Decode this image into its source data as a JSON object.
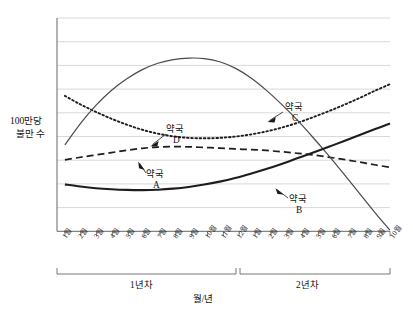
{
  "chart_data": {
    "type": "line",
    "title": "",
    "xlabel": "월/년",
    "ylabel": "100만당 불만 수",
    "ylabel_line1": "100만당",
    "ylabel_line2": "불만 수",
    "grid": true,
    "legend_position": "inline-annotations",
    "xlim": [
      0,
      21
    ],
    "ylim": [
      0,
      10
    ],
    "categories": [
      "1월",
      "2월",
      "3월",
      "4월",
      "5월",
      "6월",
      "7월",
      "8월",
      "9월",
      "10월",
      "11월",
      "12월",
      "1월",
      "2월",
      "3월",
      "4월",
      "5월",
      "6월",
      "7월",
      "8월",
      "9월",
      "10월"
    ],
    "x_groups": [
      {
        "label": "1년차",
        "start_index": 0,
        "end_index": 11
      },
      {
        "label": "2년차",
        "start_index": 12,
        "end_index": 21
      }
    ],
    "series": [
      {
        "name": "약국 A",
        "label_line1": "약국",
        "label_line2": "A",
        "style": "dashed",
        "color": "#1d1d1d",
        "values": [
          3.35,
          3.47,
          3.58,
          3.69,
          3.8,
          3.89,
          3.95,
          3.97,
          3.96,
          3.93,
          3.9,
          3.86,
          3.83,
          3.79,
          3.73,
          3.66,
          3.58,
          3.48,
          3.37,
          3.25,
          3.12,
          3.0
        ]
      },
      {
        "name": "약국 B",
        "label_line1": "약국",
        "label_line2": "B",
        "style": "solid-thick",
        "color": "#1d1d1d",
        "values": [
          2.2,
          2.1,
          2.02,
          1.97,
          1.94,
          1.93,
          1.95,
          2.0,
          2.08,
          2.19,
          2.33,
          2.5,
          2.7,
          2.92,
          3.16,
          3.42,
          3.68,
          3.95,
          4.22,
          4.5,
          4.78,
          5.05
        ]
      },
      {
        "name": "약국 C",
        "label_line1": "약국",
        "label_line2": "C",
        "style": "solid-thin",
        "color": "#4a4a4a",
        "values": [
          4.05,
          5.05,
          5.9,
          6.6,
          7.15,
          7.58,
          7.88,
          8.05,
          8.12,
          8.1,
          7.95,
          7.65,
          7.2,
          6.62,
          5.95,
          5.22,
          4.42,
          3.58,
          2.7,
          1.8,
          0.9,
          0.05
        ]
      },
      {
        "name": "약국 D",
        "label_line1": "약국",
        "label_line2": "D",
        "style": "dotted",
        "color": "#1d1d1d",
        "values": [
          6.35,
          5.95,
          5.6,
          5.28,
          5.0,
          4.76,
          4.58,
          4.45,
          4.38,
          4.36,
          4.38,
          4.44,
          4.54,
          4.68,
          4.86,
          5.08,
          5.34,
          5.62,
          5.92,
          6.24,
          6.58,
          6.9
        ]
      }
    ],
    "gridline_count": 9,
    "annotations": [
      {
        "series": "약국 A",
        "text_line1": "약국",
        "text_line2": "A"
      },
      {
        "series": "약국 B",
        "text_line1": "약국",
        "text_line2": "B"
      },
      {
        "series": "약국 C",
        "text_line1": "약국",
        "text_line2": "C"
      },
      {
        "series": "약국 D",
        "text_line1": "약국",
        "text_line2": "D"
      }
    ]
  }
}
